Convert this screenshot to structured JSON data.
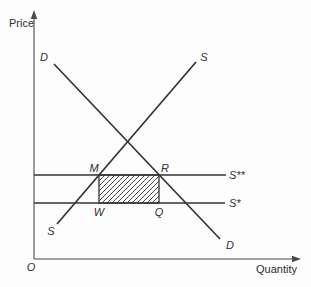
{
  "figure": {
    "background": "#fdfdfd",
    "line_color": "#333333",
    "axis_color": "#4a4a4a",
    "axes": {
      "y_label": "Price",
      "x_label": "Quantity",
      "origin_label": "O"
    },
    "curves": {
      "demand_top_label": "D",
      "demand_bottom_label": "D",
      "supply_top_label": "S",
      "supply_bottom_label": "S",
      "world_price_upper_label": "S**",
      "world_price_lower_label": "S*"
    },
    "points": {
      "m_label": "M",
      "r_label": "R",
      "w_label": "W",
      "q_label": "Q"
    }
  }
}
